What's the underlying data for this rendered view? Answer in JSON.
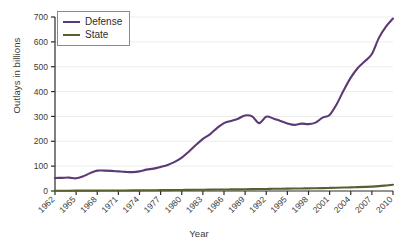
{
  "chart_data": {
    "type": "line",
    "title": "",
    "xlabel": "Year",
    "ylabel": "Outlays in billions",
    "xlim": [
      1962,
      2010
    ],
    "ylim": [
      0,
      700
    ],
    "ytick_values": [
      0,
      100,
      200,
      300,
      400,
      500,
      600,
      700
    ],
    "ytick_labels": [
      "0",
      "100",
      "200",
      "300",
      "400",
      "500",
      "600",
      "700"
    ],
    "xtick_labels": [
      "1962",
      "1965",
      "1968",
      "1971",
      "1974",
      "1977",
      "1980",
      "1983",
      "1986",
      "1989",
      "1992",
      "1995",
      "1998",
      "2001",
      "2004",
      "2007",
      "2010"
    ],
    "grid": "horizontal-light",
    "legend_position": "top-left-inside",
    "x": [
      1962,
      1963,
      1964,
      1965,
      1966,
      1967,
      1968,
      1969,
      1970,
      1971,
      1972,
      1973,
      1974,
      1975,
      1976,
      1977,
      1978,
      1979,
      1980,
      1981,
      1982,
      1983,
      1984,
      1985,
      1986,
      1987,
      1988,
      1989,
      1990,
      1991,
      1992,
      1993,
      1994,
      1995,
      1996,
      1997,
      1998,
      1999,
      2000,
      2001,
      2002,
      2003,
      2004,
      2005,
      2006,
      2007,
      2008,
      2009,
      2010
    ],
    "series": [
      {
        "name": "Defense",
        "color": "#5c3a76",
        "values": [
          52,
          53,
          54,
          51,
          59,
          72,
          82,
          82,
          81,
          79,
          77,
          76,
          79,
          86,
          90,
          97,
          105,
          117,
          134,
          158,
          185,
          210,
          228,
          253,
          273,
          282,
          291,
          304,
          300,
          273,
          299,
          292,
          282,
          272,
          266,
          271,
          269,
          275,
          295,
          306,
          349,
          405,
          456,
          495,
          522,
          551,
          616,
          661,
          694
        ]
      },
      {
        "name": "State",
        "color": "#5a5f30",
        "values": [
          1.1,
          1.2,
          1.3,
          1.4,
          1.5,
          1.6,
          1.7,
          1.8,
          1.9,
          2.1,
          2.3,
          2.5,
          2.7,
          2.9,
          3.2,
          3.4,
          3.6,
          3.9,
          4.2,
          4.5,
          4.8,
          5.1,
          5.5,
          5.9,
          6.1,
          6.4,
          6.7,
          7.0,
          7.4,
          7.8,
          8.3,
          8.8,
          9.2,
          9.5,
          9.8,
          10.2,
          10.6,
          11.1,
          11.7,
          12.4,
          13.1,
          13.9,
          14.7,
          15.6,
          16.5,
          17.6,
          19.5,
          22.3,
          25.4
        ]
      }
    ]
  },
  "legend": {
    "entries": [
      {
        "label": "Defense",
        "color": "#5c3a76"
      },
      {
        "label": "State",
        "color": "#5a5f30"
      }
    ]
  },
  "axes": {
    "y_axis_title": "Outlays in billions",
    "x_axis_title": "Year"
  }
}
